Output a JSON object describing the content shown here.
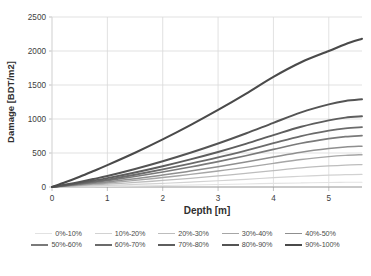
{
  "chart_data": {
    "type": "line",
    "title": "",
    "xlabel": "Depth [m]",
    "ylabel": "Damage [BDT/m2]",
    "xlim": [
      0,
      5.6
    ],
    "ylim": [
      0,
      2500
    ],
    "xticks": [
      "0",
      "1",
      "2",
      "3",
      "4",
      "5"
    ],
    "yticks": [
      "0",
      "500",
      "1000",
      "1500",
      "2000",
      "2500"
    ],
    "grid": true,
    "legend_position": "bottom",
    "x": [
      0,
      0.25,
      0.5,
      0.75,
      1,
      1.5,
      2,
      2.5,
      3,
      3.5,
      4,
      4.5,
      5,
      5.3,
      5.6
    ],
    "series": [
      {
        "name": "0%-10%",
        "color": "#e2e2e2",
        "width": 1.1,
        "values": [
          0,
          2,
          4,
          6,
          9,
          15,
          22,
          29,
          37,
          45,
          53,
          60,
          66,
          69,
          70
        ]
      },
      {
        "name": "10%-20%",
        "color": "#d2d2d2",
        "width": 1.2,
        "values": [
          0,
          5,
          11,
          17,
          23,
          38,
          54,
          72,
          92,
          113,
          137,
          158,
          174,
          181,
          185
        ]
      },
      {
        "name": "20%-30%",
        "color": "#bdbdbd",
        "width": 1.3,
        "values": [
          0,
          9,
          19,
          30,
          41,
          67,
          96,
          128,
          163,
          201,
          242,
          281,
          310,
          323,
          330
        ]
      },
      {
        "name": "30%-40%",
        "color": "#a6a6a6",
        "width": 1.4,
        "values": [
          0,
          13,
          28,
          43,
          59,
          97,
          139,
          185,
          235,
          289,
          348,
          404,
          447,
          465,
          475
        ]
      },
      {
        "name": "40%-50%",
        "color": "#8f8f8f",
        "width": 1.5,
        "values": [
          0,
          17,
          35,
          55,
          75,
          123,
          176,
          234,
          297,
          366,
          440,
          511,
          565,
          588,
          600
        ]
      },
      {
        "name": "50%-60%",
        "color": "#7a7a7a",
        "width": 1.7,
        "values": [
          0,
          21,
          44,
          69,
          94,
          154,
          221,
          294,
          373,
          460,
          553,
          643,
          711,
          740,
          755
        ]
      },
      {
        "name": "60%-70%",
        "color": "#6b6b6b",
        "width": 1.8,
        "values": [
          0,
          25,
          51,
          80,
          110,
          180,
          258,
          343,
          435,
          536,
          644,
          749,
          829,
          863,
          880
        ]
      },
      {
        "name": "70%-80%",
        "color": "#5e5e5e",
        "width": 1.9,
        "values": [
          0,
          29,
          60,
          95,
          130,
          213,
          305,
          406,
          515,
          634,
          762,
          886,
          980,
          1020,
          1040
        ]
      },
      {
        "name": "80%-90%",
        "color": "#545454",
        "width": 2.0,
        "values": [
          0,
          36,
          75,
          118,
          161,
          264,
          378,
          503,
          639,
          786,
          944,
          1098,
          1215,
          1265,
          1290
        ]
      },
      {
        "name": "90%-100%",
        "color": "#4a4a4a",
        "width": 2.1,
        "values": [
          0,
          73,
          152,
          236,
          322,
          504,
          700,
          910,
          1133,
          1370,
          1620,
          1835,
          2000,
          2100,
          2180
        ]
      }
    ]
  },
  "axes": {
    "x_title": "Depth [m]",
    "y_title": "Damage [BDT/m2]"
  },
  "legend": {
    "rows": [
      [
        {
          "label": "0%-10%",
          "color": "#e2e2e2",
          "width": 1.1
        },
        {
          "label": "10%-20%",
          "color": "#d2d2d2",
          "width": 1.2
        },
        {
          "label": "20%-30%",
          "color": "#bdbdbd",
          "width": 1.3
        },
        {
          "label": "30%-40%",
          "color": "#a6a6a6",
          "width": 1.4
        },
        {
          "label": "40%-50%",
          "color": "#8f8f8f",
          "width": 1.6
        }
      ],
      [
        {
          "label": "50%-60%",
          "color": "#7a7a7a",
          "width": 1.8
        },
        {
          "label": "60%-70%",
          "color": "#6b6b6b",
          "width": 1.9
        },
        {
          "label": "70%-80%",
          "color": "#5e5e5e",
          "width": 2.0
        },
        {
          "label": "80%-90%",
          "color": "#545454",
          "width": 2.1
        },
        {
          "label": "90%-100%",
          "color": "#4a4a4a",
          "width": 2.2
        }
      ]
    ]
  },
  "style": {
    "plot_bg": "#ffffff",
    "grid_color": "#d9d9d9",
    "axis_color": "#b0b0b0",
    "text_color": "#404040"
  }
}
